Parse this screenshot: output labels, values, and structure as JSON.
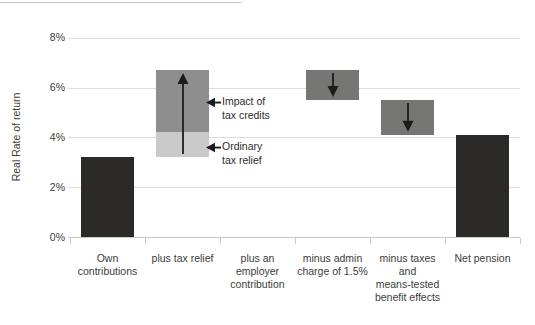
{
  "chart_data": {
    "type": "bar",
    "subtype": "waterfall",
    "title": "",
    "xlabel": "",
    "ylabel": "Real Rate of return",
    "ylim": [
      0,
      8
    ],
    "yticks": [
      0,
      2,
      4,
      6,
      8
    ],
    "ytick_labels": [
      "0%",
      "2%",
      "4%",
      "6%",
      "8%"
    ],
    "grid": "horizontal",
    "legend": "none",
    "categories": [
      "Own contributions",
      "plus tax relief",
      "plus an employer contribution",
      "minus admin charge of 1.5%",
      "minus taxes and means-tested benefit effects",
      "Net pension"
    ],
    "bars": [
      {
        "category": "Own contributions",
        "label_lines": [
          "Own",
          "contributions"
        ],
        "segments": [
          {
            "from": 0,
            "to": 3.2,
            "color_key": "dark"
          }
        ]
      },
      {
        "category": "plus tax relief",
        "label_lines": [
          "plus tax relief"
        ],
        "arrow": "up",
        "segments": [
          {
            "name": "Ordinary tax relief",
            "from": 3.2,
            "to": 4.2,
            "color_key": "light_gray"
          },
          {
            "name": "Impact of tax credits",
            "from": 4.2,
            "to": 6.7,
            "color_key": "mid_gray"
          }
        ]
      },
      {
        "category": "plus an employer contribution",
        "label_lines": [
          "plus an",
          "employer",
          "contribution"
        ],
        "segments": []
      },
      {
        "category": "minus admin charge of 1.5%",
        "label_lines": [
          "minus admin",
          "charge of 1.5%"
        ],
        "arrow": "down",
        "segments": [
          {
            "from": 5.5,
            "to": 6.7,
            "color_key": "minus_gray"
          }
        ]
      },
      {
        "category": "minus taxes and means-tested benefit effects",
        "label_lines": [
          "minus taxes",
          "and",
          "means-tested",
          "benefit effects"
        ],
        "arrow": "down",
        "segments": [
          {
            "from": 4.1,
            "to": 5.5,
            "color_key": "minus_gray"
          }
        ]
      },
      {
        "category": "Net pension",
        "label_lines": [
          "Net pension"
        ],
        "segments": [
          {
            "from": 0,
            "to": 4.1,
            "color_key": "dark"
          }
        ]
      }
    ],
    "annotations": [
      {
        "label": "Impact of tax credits",
        "lines": [
          "Impact of",
          "tax credits"
        ]
      },
      {
        "label": "Ordinary tax relief",
        "lines": [
          "Ordinary",
          "tax relief"
        ]
      }
    ],
    "colors": {
      "dark": "#2b2a29",
      "mid_gray": "#8e8e8e",
      "light_gray": "#cacaca",
      "minus_gray": "#767675",
      "arrow": "#1c1c1c",
      "gridline": "#dedede",
      "axis": "#c9c9c9",
      "text": "#3c3c3c"
    }
  }
}
